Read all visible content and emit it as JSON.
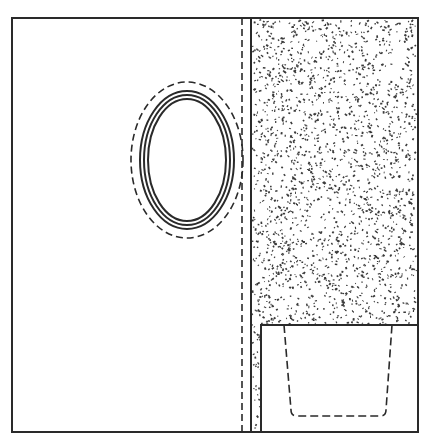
{
  "diagram": {
    "width": 429,
    "height": 442,
    "colors": {
      "background": "#ffffff",
      "stroke": "#2a2a2a",
      "stipple": "#3a3a3a"
    },
    "outer_frame": {
      "x": 12,
      "y": 18,
      "w": 406,
      "h": 414
    },
    "divider_solid_x": 251,
    "divider_dashed_x": 242,
    "stippled_region": {
      "x": 251,
      "y": 18,
      "w": 167,
      "h": 414
    },
    "inner_box": {
      "x": 261,
      "y": 325,
      "w": 157,
      "h": 107
    },
    "ellipses": {
      "cx": 187,
      "cy": 160,
      "dashed": {
        "rx": 56,
        "ry": 78
      },
      "solid": [
        {
          "rx": 47,
          "ry": 69
        },
        {
          "rx": 43,
          "ry": 65
        },
        {
          "rx": 39,
          "ry": 61
        }
      ]
    },
    "dashed_container": {
      "top_left": [
        284,
        325
      ],
      "top_right": [
        392,
        325
      ],
      "bottom_left": [
        291,
        416
      ],
      "bottom_right": [
        386,
        416
      ],
      "corner_radius": 6
    },
    "stipple_seed": 7,
    "stipple_count": 2600
  }
}
